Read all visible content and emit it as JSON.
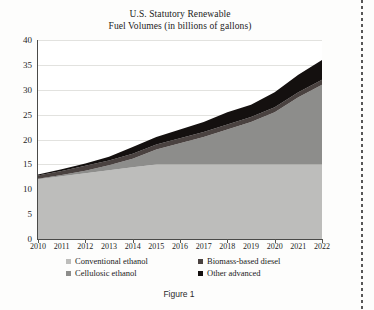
{
  "figure": {
    "title_line1": "U.S. Statutory Renewable",
    "title_line2": "Fuel Volumes (in billions of gallons)",
    "caption": "Figure 1"
  },
  "colors": {
    "conventional_ethanol": "#bdbdbb",
    "cellulosic_ethanol": "#8d8d8b",
    "biomass_based_diesel": "#4a4240",
    "other_advanced": "#14100f",
    "axis": "#4a4a48",
    "grid": "#e2e2df",
    "plot_background": "#ffffff",
    "page_background": "#fdfdfc",
    "text": "#1b1b1b"
  },
  "legend": {
    "position": "below-axis",
    "entries": [
      {
        "label": "Conventional ethanol",
        "color": "#bdbdbb"
      },
      {
        "label": "Biomass-based diesel",
        "color": "#4a4240"
      },
      {
        "label": "Cellulosic ethanol",
        "color": "#8d8d8b"
      },
      {
        "label": "Other advanced",
        "color": "#14100f"
      }
    ]
  },
  "chart_data": {
    "type": "area",
    "stacked": true,
    "title": "U.S. Statutory Renewable Fuel Volumes (in billions of gallons)",
    "xlabel": "",
    "ylabel": "",
    "ylim": [
      0,
      40
    ],
    "yticks": [
      0,
      5,
      10,
      15,
      20,
      25,
      30,
      35,
      40
    ],
    "ytick_labels": [
      "0",
      "5",
      "10",
      "15",
      "20",
      "25",
      "30",
      "35",
      "40"
    ],
    "grid": true,
    "legend_position": "bottom",
    "x": [
      2010,
      2011,
      2012,
      2013,
      2014,
      2015,
      2016,
      2017,
      2018,
      2019,
      2020,
      2021,
      2022
    ],
    "xtick_labels": [
      "2010",
      "2011",
      "2012",
      "2013",
      "2014",
      "2015",
      "2016",
      "2017",
      "2018",
      "2019",
      "2020",
      "2021",
      "2022"
    ],
    "series": [
      {
        "name": "Conventional ethanol",
        "color": "#bdbdbb",
        "values": [
          12.0,
          12.6,
          13.2,
          13.8,
          14.4,
          15.0,
          15.0,
          15.0,
          15.0,
          15.0,
          15.0,
          15.0,
          15.0
        ]
      },
      {
        "name": "Cellulosic ethanol",
        "color": "#8d8d8b",
        "values": [
          0.1,
          0.25,
          0.5,
          1.0,
          1.75,
          3.0,
          4.25,
          5.5,
          7.0,
          8.5,
          10.5,
          13.5,
          16.0
        ]
      },
      {
        "name": "Biomass-based diesel",
        "color": "#4a4240",
        "values": [
          0.65,
          0.8,
          1.0,
          1.0,
          1.0,
          1.0,
          1.0,
          1.0,
          1.0,
          1.0,
          1.0,
          1.0,
          1.0
        ]
      },
      {
        "name": "Other advanced",
        "color": "#14100f",
        "values": [
          0.2,
          0.35,
          0.5,
          0.75,
          1.35,
          1.5,
          1.75,
          2.0,
          2.5,
          2.5,
          3.0,
          3.5,
          4.0
        ]
      }
    ],
    "totals": [
      12.95,
      14.0,
      15.2,
      16.55,
      18.5,
      20.5,
      22.0,
      23.5,
      25.5,
      27.0,
      29.5,
      33.0,
      36.0
    ]
  }
}
